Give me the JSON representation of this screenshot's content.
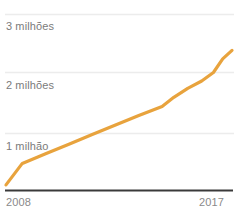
{
  "chart_data": {
    "type": "line",
    "title": "",
    "subtitle": "",
    "xlabel": "",
    "ylabel": "",
    "xlim": [
      2008,
      2017
    ],
    "ylim": [
      0,
      3200000
    ],
    "grid": true,
    "legend": false,
    "legend_position": "none",
    "line_color": "#E8A33D",
    "axis_color": "#3a3a3a",
    "grid_color": "#ececec",
    "tick_text_color": "#7b7b7b",
    "x_ticks": [
      {
        "value": 2008,
        "label": "2008"
      },
      {
        "value": 2017,
        "label": "2017"
      }
    ],
    "y_ticks": [
      {
        "value": 3000000,
        "label": "3 milhões"
      },
      {
        "value": 2000000,
        "label": "2 milhões"
      },
      {
        "value": 1000000,
        "label": "1 milhão"
      }
    ],
    "x": [
      2008,
      2008.7,
      2009.7,
      2010.7,
      2011.7,
      2012.7,
      2013.7,
      2014.7,
      2015.2,
      2015.8,
      2016.4,
      2016.9,
      2017.3,
      2017.7
    ],
    "values": [
      90000,
      470000,
      640000,
      810000,
      980000,
      1150000,
      1320000,
      1480000,
      1640000,
      1800000,
      1930000,
      2080000,
      2320000,
      2470000
    ],
    "series": [
      {
        "name": "",
        "values": [
          90000,
          470000,
          640000,
          810000,
          980000,
          1150000,
          1320000,
          1480000,
          1640000,
          1800000,
          1930000,
          2080000,
          2320000,
          2470000
        ]
      }
    ],
    "annotations": []
  },
  "axes": {
    "y_tick_labels": {
      "three_million": "3 milhões",
      "two_million": "2 milhões",
      "one_million": "1 milhão"
    },
    "x_tick_labels": {
      "start_year": "2008",
      "end_year": "2017"
    }
  }
}
